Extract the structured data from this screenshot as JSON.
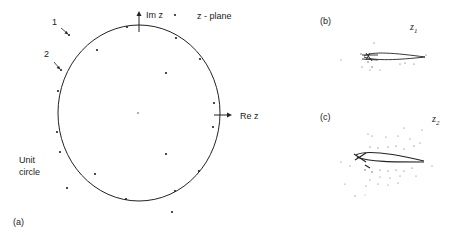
{
  "figure": {
    "panel_a": {
      "label": "(a)",
      "plane_label": "z - plane",
      "axis_im": "Im z",
      "axis_re": "Re z",
      "unit_circle_label_line1": "Unit",
      "unit_circle_label_line2": "circle",
      "marker_1": "1",
      "marker_2": "2",
      "circle": {
        "cx": 139,
        "cy": 113,
        "rx": 81,
        "ry": 88
      },
      "points_on_circle": [
        [
          127,
          27
        ],
        [
          176,
          38
        ],
        [
          200,
          59
        ],
        [
          214,
          103
        ],
        [
          213,
          127
        ],
        [
          199,
          171
        ],
        [
          175,
          191
        ],
        [
          126,
          199
        ],
        [
          58,
          132
        ],
        [
          58,
          91
        ]
      ],
      "points_off_circle": [
        [
          69,
          35
        ],
        [
          97,
          50
        ],
        [
          167,
          73
        ],
        [
          61,
          70
        ],
        [
          60,
          152
        ],
        [
          95,
          174
        ],
        [
          67,
          188
        ],
        [
          173,
          212
        ],
        [
          175,
          15
        ],
        [
          166,
          154
        ],
        [
          138,
          113
        ],
        [
          138,
          114
        ]
      ]
    },
    "panel_b": {
      "label": "(b)",
      "z_label": "z",
      "z_sub": "1"
    },
    "panel_c": {
      "label": "(c)",
      "z_label": "z",
      "z_sub": "2"
    }
  },
  "colors": {
    "ink": "#222222",
    "background": "#ffffff"
  }
}
